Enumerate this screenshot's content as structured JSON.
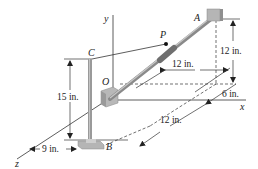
{
  "figure": {
    "points": {
      "A": "A",
      "B": "B",
      "C": "C",
      "O": "O",
      "P": "P"
    },
    "axes": {
      "x": "x",
      "y": "y",
      "z": "z"
    },
    "dimensions": {
      "ax_span": "12 in.",
      "a_height": "12 in.",
      "a_z_offset": "6 in.",
      "c_height": "15 in.",
      "b_z_span": "12 in.",
      "b_x_offset": "9 in."
    },
    "colors": {
      "line": "#333333",
      "rod": "#8a8a8a",
      "block": "#b5b5b5"
    }
  }
}
